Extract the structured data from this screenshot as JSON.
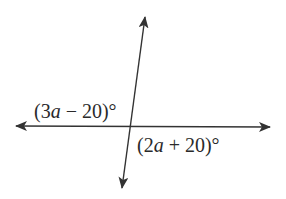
{
  "diagram": {
    "type": "intersecting-lines",
    "line_color": "#333333",
    "background": "#ffffff",
    "lines": [
      {
        "name": "horizontal-line",
        "from": [
          15,
          126
        ],
        "to": [
          271,
          127
        ],
        "arrows": "both"
      },
      {
        "name": "slanted-line",
        "from": [
          145,
          16
        ],
        "to": [
          122,
          189
        ],
        "arrows": "both"
      }
    ],
    "intersection": [
      131,
      126
    ],
    "angles": [
      {
        "name": "upper-left-angle",
        "open": "(",
        "coef": "3",
        "var": "a",
        "op": " − ",
        "const": "20",
        "close": ")°"
      },
      {
        "name": "lower-right-angle",
        "open": "(",
        "coef": "2",
        "var": "a",
        "op": " + ",
        "const": "20",
        "close": ")°"
      }
    ]
  }
}
